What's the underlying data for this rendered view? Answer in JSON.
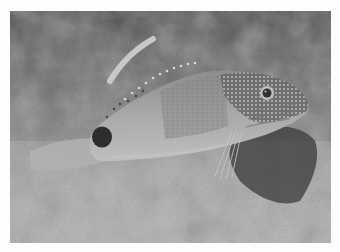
{
  "photo": {
    "subject": "fish",
    "description": "Grayscale photograph of a spotted hawkfish-like fish resting on a sandy reef, with a dark eyespot near the tail",
    "colors": {
      "border": "#fdfdfd",
      "background_dark": "#2a2a2a",
      "sand": "#b4b4b4",
      "fish_body": "#a8a8a8",
      "eyespot": "#0e0e0e"
    }
  }
}
